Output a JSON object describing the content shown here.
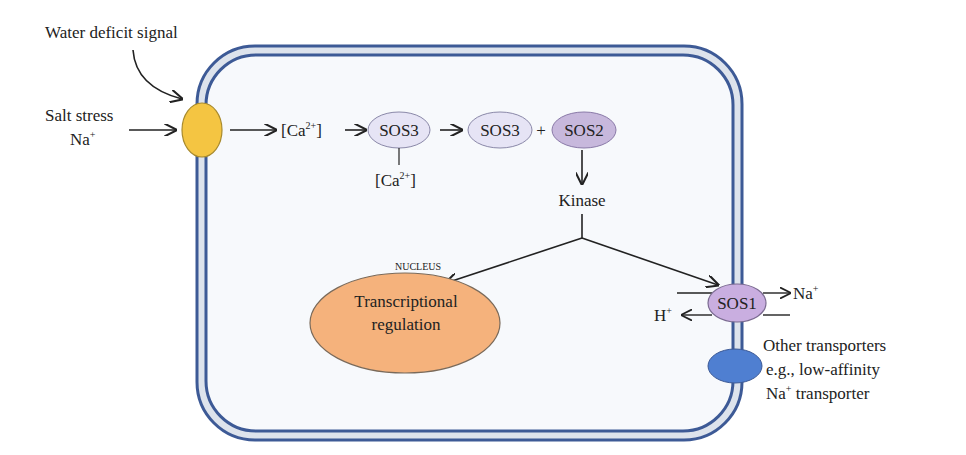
{
  "diagram": {
    "labels": {
      "water_deficit": "Water deficit signal",
      "salt_stress": "Salt stress",
      "na_plus": "Na",
      "plus_sup": "+",
      "ca_bracket_open": "[Ca",
      "ca_sup": "2+",
      "ca_bracket_close": "]",
      "sos3": "SOS3",
      "sos3_b": "SOS3",
      "plus": "+",
      "sos2": "SOS2",
      "kinase": "Kinase",
      "nucleus": "NUCLEUS",
      "transcriptional": "Transcriptional",
      "regulation": "regulation",
      "sos1": "SOS1",
      "na_out": "Na",
      "h_in": "H",
      "other_1": "Other transporters",
      "other_2": "e.g., low-affinity",
      "other_3_a": "Na",
      "other_3_b": " transporter"
    },
    "colors": {
      "membrane_line": "#3d5a96",
      "membrane_fill": "#dde3ec",
      "cell_fill": "#f7f9fc",
      "sensor": "#f4c542",
      "sos3": "#e6e4f5",
      "sos2": "#c7b8dc",
      "sos1": "#c9aee0",
      "nucleus": "#f5b27c",
      "other_transporter": "#4f7fd1"
    }
  }
}
